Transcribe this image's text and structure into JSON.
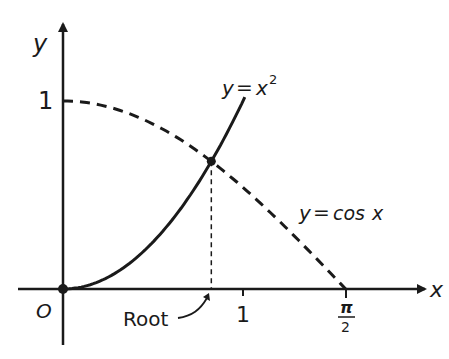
{
  "diagram": {
    "axes": {
      "x_label": "x",
      "y_label": "y",
      "origin_label": "O",
      "x_ticks": [
        {
          "label": "1",
          "value": 1
        },
        {
          "label_num": "π",
          "label_den": "2",
          "value": 1.5708
        }
      ],
      "y_ticks": [
        {
          "label": "1",
          "value": 1
        }
      ]
    },
    "curves": [
      {
        "name": "parabola",
        "label": "y = x²",
        "label_y": "y",
        "label_eq": "=",
        "label_x": "x",
        "label_exp": "2",
        "style": "solid",
        "domain": [
          0,
          1.01
        ]
      },
      {
        "name": "cosine",
        "label": "y = cos x",
        "label_y": "y",
        "label_eq": "=",
        "label_fn": "cos",
        "label_x": "x",
        "style": "dashed",
        "domain": [
          0,
          1.5708
        ]
      }
    ],
    "intersection": {
      "x": 0.824,
      "y": 0.679,
      "annotation": "Root"
    },
    "colors": {
      "ink": "#1a1a1a",
      "background": "#ffffff"
    }
  }
}
